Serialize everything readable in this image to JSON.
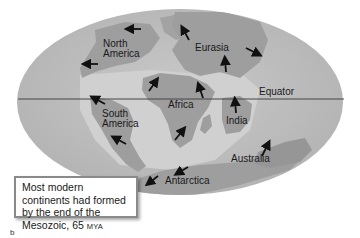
{
  "figure": {
    "colors": {
      "ocean": "#bcbcbc",
      "land": "#9a9a9a",
      "shelf": "#d2d2d2",
      "arrow": "#111111",
      "equator_line": "#444444"
    },
    "labels": {
      "north_america": "North\nAmerica",
      "north_america_l1": "North",
      "north_america_l2": "America",
      "eurasia": "Eurasia",
      "equator": "Equator",
      "africa": "Africa",
      "south_america_l1": "South",
      "south_america_l2": "America",
      "india": "India",
      "australia": "Australia",
      "antarctica": "Antarctica"
    },
    "caption": {
      "text_main": "Most modern continents had formed by the end of the Mesozoic, 65 ",
      "text_unit": "MYA"
    },
    "figure_letter": "b",
    "arrows": [
      {
        "name": "north-america-arrow-top",
        "direction": "west"
      },
      {
        "name": "north-america-arrow-bottom",
        "direction": "west"
      },
      {
        "name": "eurasia-arrow-west",
        "direction": "north-west"
      },
      {
        "name": "eurasia-arrow-center",
        "direction": "north"
      },
      {
        "name": "eurasia-arrow-east",
        "direction": "south-east"
      },
      {
        "name": "africa-arrow-nw",
        "direction": "north-east"
      },
      {
        "name": "africa-arrow-ne",
        "direction": "north"
      },
      {
        "name": "africa-arrow-south",
        "direction": "north-east"
      },
      {
        "name": "india-arrow",
        "direction": "north"
      },
      {
        "name": "south-america-arrow-top",
        "direction": "north-west"
      },
      {
        "name": "south-america-arrow-bottom",
        "direction": "north-west"
      },
      {
        "name": "antarctica-arrow-left",
        "direction": "south-west"
      },
      {
        "name": "antarctica-arrow-right",
        "direction": "south-west"
      },
      {
        "name": "australia-arrow",
        "direction": "north-east"
      }
    ]
  }
}
